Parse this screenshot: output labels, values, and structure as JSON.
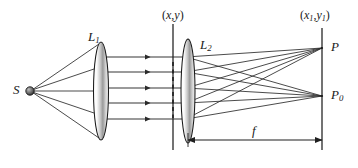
{
  "figure": {
    "type": "ray-diagram",
    "width": 358,
    "height": 168,
    "background_color": "#ffffff",
    "line_color": "#2b2b2b"
  },
  "labels": {
    "source": "S",
    "lens1": "L",
    "lens1_sub": "1",
    "lens2": "L",
    "lens2_sub": "2",
    "plane_xy_open": "(",
    "plane_xy_x": "x",
    "plane_xy_comma": ",",
    "plane_xy_y": "y",
    "plane_xy_close": ")",
    "plane_x1y1_open": "(",
    "plane_x1y1_x": "x",
    "plane_x1y1_xsub": "1",
    "plane_x1y1_comma": ",",
    "plane_x1y1_y": "y",
    "plane_x1y1_ysub": "1",
    "plane_x1y1_close": ")",
    "point_P": "P",
    "point_P0": "P",
    "point_P0_sub": "0",
    "focal_length": "f"
  },
  "elements": {
    "source_point": {
      "x": 30,
      "y": 91,
      "radius": 4.2
    },
    "lens1": {
      "cx": 101,
      "cy": 91,
      "rx": 7.5,
      "ry": 49
    },
    "lens2": {
      "cx": 188,
      "cy": 91,
      "rx": 7.0,
      "ry": 52
    },
    "plane_xy_line": {
      "x": 173,
      "y1": 24,
      "y2": 150
    },
    "screen_line": {
      "x": 322,
      "y1": 28,
      "y2": 150
    },
    "dashed_segment": {
      "x": 173,
      "y1": 62,
      "y2": 118
    },
    "point_P": {
      "x": 322,
      "y": 48
    },
    "point_P0": {
      "x": 322,
      "y": 96
    },
    "focal_arrow": {
      "x1": 188,
      "x2": 322,
      "y": 140
    },
    "parallel_rays_y": [
      57,
      72,
      88,
      103,
      119
    ],
    "arrowhead_x": 158
  },
  "ray_bundles": {
    "source_to_lens1_description": "Five diverging rays from S to the edges and interior of lens L1",
    "lens1_to_lens2_description": "Five horizontal parallel rays, each with an arrowhead before the (x,y) plane",
    "lens2_to_P_description": "Converging rays from lens L2 aperture to point P on the screen",
    "lens2_to_P0_description": "Converging rays from lens L2 aperture to point P0 on the screen"
  }
}
